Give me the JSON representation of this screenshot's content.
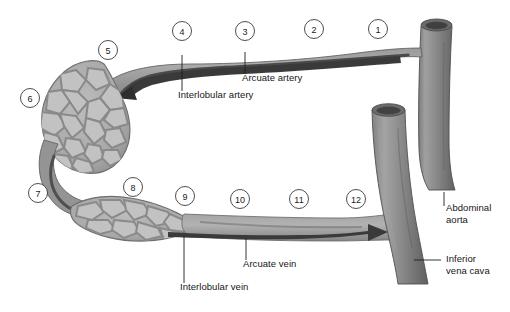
{
  "figure": {
    "width": 510,
    "height": 312,
    "background_color": "#ffffff"
  },
  "colors": {
    "vessel_mid_gray": "#8d8d8d",
    "vessel_dark_gray": "#6f6f6f",
    "vessel_light_gray": "#b3b3b3",
    "lumen_dark": "#4a4a4a",
    "cortex_cell_fill": "#b8b8b8",
    "cortex_border": "#8a8a8a",
    "outline": "#5a5a5a",
    "text": "#161616",
    "circle_stroke": "#3a3a3a"
  },
  "numbered_markers": [
    {
      "label": "1",
      "x": 378,
      "y": 29
    },
    {
      "label": "2",
      "x": 314,
      "y": 29
    },
    {
      "label": "3",
      "x": 245,
      "y": 31
    },
    {
      "label": "4",
      "x": 182,
      "y": 31
    },
    {
      "label": "5",
      "x": 108,
      "y": 50
    },
    {
      "label": "6",
      "x": 30,
      "y": 98
    },
    {
      "label": "7",
      "x": 38,
      "y": 193
    },
    {
      "label": "8",
      "x": 133,
      "y": 187
    },
    {
      "label": "9",
      "x": 185,
      "y": 196
    },
    {
      "label": "10",
      "x": 240,
      "y": 199
    },
    {
      "label": "11",
      "x": 299,
      "y": 199
    },
    {
      "label": "12",
      "x": 356,
      "y": 199
    }
  ],
  "callouts": [
    {
      "name": "arcuate-artery",
      "text": "Arcuate artery",
      "text_x": 242,
      "text_y": 78,
      "leader": {
        "x1": 245,
        "y1": 52,
        "x2": 245,
        "y2": 74
      }
    },
    {
      "name": "interlobular-artery",
      "text": "Interlobular artery",
      "text_x": 178,
      "text_y": 95,
      "leader": {
        "x1": 182,
        "y1": 55,
        "x2": 182,
        "y2": 91
      }
    },
    {
      "name": "arcuate-vein",
      "text": "Arcuate vein",
      "text_x": 243,
      "text_y": 264,
      "leader": {
        "x1": 246,
        "y1": 238,
        "x2": 246,
        "y2": 260
      }
    },
    {
      "name": "interlobular-vein",
      "text": "Interlobular vein",
      "text_x": 180,
      "text_y": 287,
      "leader": {
        "x1": 184,
        "y1": 236,
        "x2": 184,
        "y2": 283
      }
    },
    {
      "name": "abdominal-aorta",
      "text": "Abdominal\naorta",
      "text_x": 446,
      "text_y": 208,
      "leader": {
        "x1": 444,
        "y1": 192,
        "x2": 444,
        "y2": 206
      }
    },
    {
      "name": "inferior-vena-cava",
      "text": "Inferior\nvena cava",
      "text_x": 446,
      "text_y": 255,
      "leader": {
        "x1": 414,
        "y1": 260,
        "x2": 441,
        "y2": 260
      }
    }
  ],
  "flow_arrows": [
    {
      "name": "arterial-flow-arrow",
      "direction": "left",
      "description": "Blood flow from aorta toward renal cortex"
    },
    {
      "name": "venous-flow-arrow",
      "direction": "right",
      "description": "Blood flow from renal cortex toward vena cava"
    }
  ],
  "structures": [
    {
      "name": "abdominal-aorta-vessel",
      "kind": "artery"
    },
    {
      "name": "inferior-vena-cava-vessel",
      "kind": "vein"
    },
    {
      "name": "renal-artery-branch",
      "kind": "artery"
    },
    {
      "name": "renal-vein-branch",
      "kind": "vein"
    },
    {
      "name": "upper-cortex-mass",
      "kind": "cortical-tissue"
    },
    {
      "name": "lower-cortex-mass",
      "kind": "cortical-tissue"
    }
  ]
}
